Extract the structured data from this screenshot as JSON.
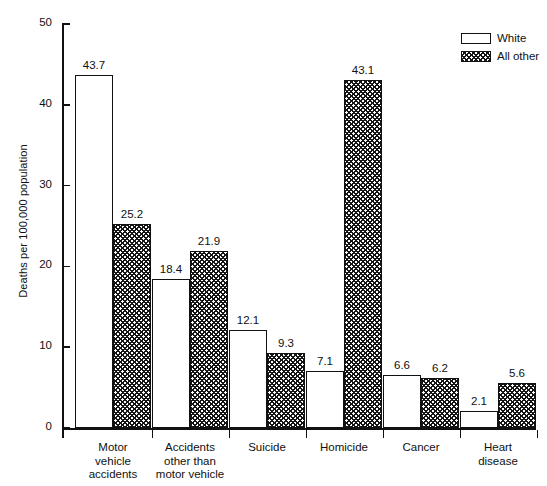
{
  "chart_data": {
    "type": "bar",
    "title": "",
    "xlabel": "",
    "ylabel": "Deaths per 100,000 population",
    "ylim": [
      0,
      50
    ],
    "ytick_labels": [
      "0",
      "10",
      "20",
      "30",
      "40",
      "50"
    ],
    "ytick_values": [
      0,
      10,
      20,
      30,
      40,
      50
    ],
    "grid": false,
    "legend_position": "top-right",
    "categories": [
      "Motor vehicle accidents",
      "Accidents other than motor vehicle",
      "Suicide",
      "Homicide",
      "Cancer",
      "Heart disease"
    ],
    "category_lines": [
      [
        "Motor",
        "vehicle",
        "accidents"
      ],
      [
        "Accidents",
        "other than",
        "motor vehicle"
      ],
      [
        "Suicide"
      ],
      [
        "Homicide"
      ],
      [
        "Cancer"
      ],
      [
        "Heart",
        "disease"
      ]
    ],
    "series": [
      {
        "name": "White",
        "pattern": "solid-white",
        "values": [
          43.7,
          18.4,
          12.1,
          7.1,
          6.6,
          2.1
        ],
        "labels": [
          "43.7",
          "18.4",
          "12.1",
          "7.1",
          "6.6",
          "2.1"
        ]
      },
      {
        "name": "All other",
        "pattern": "crosshatch",
        "values": [
          25.2,
          21.9,
          9.3,
          43.1,
          6.2,
          5.6
        ],
        "labels": [
          "25.2",
          "21.9",
          "9.3",
          "43.1",
          "6.2",
          "5.6"
        ]
      }
    ]
  },
  "legend": {
    "items": [
      {
        "label": "White",
        "pattern": "solid-white"
      },
      {
        "label": "All other",
        "pattern": "crosshatch"
      }
    ]
  },
  "colors": {
    "ink": "#111111",
    "background": "#ffffff",
    "hatch": "#151515"
  }
}
